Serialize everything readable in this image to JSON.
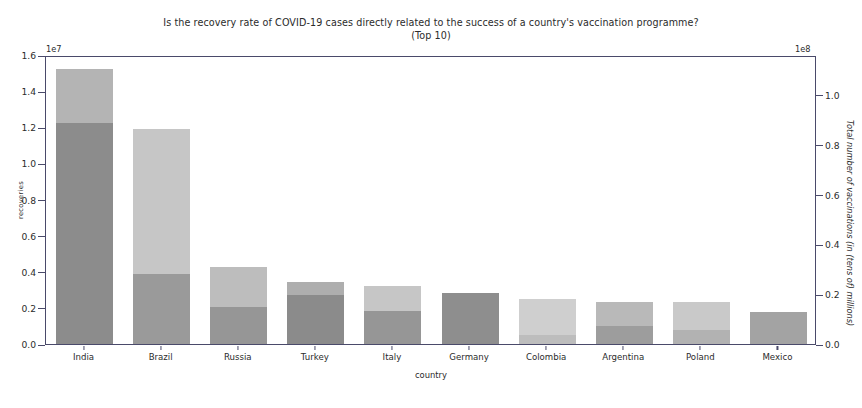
{
  "chart_data": {
    "type": "bar",
    "title": "Is the recovery rate of COVID-19 cases directly related to the success of a country's vaccination programme?",
    "subtitle": "(Top 10)",
    "xlabel": "country",
    "ylabel": "recoveries",
    "ylabel_right": "Total number of vaccinations (in (tens of) millions)",
    "categories": [
      "India",
      "Brazil",
      "Russia",
      "Turkey",
      "Italy",
      "Germany",
      "Colombia",
      "Argentina",
      "Poland",
      "Mexico"
    ],
    "series": [
      {
        "name": "recoveries",
        "axis": "left",
        "offset_text": "1e7",
        "color": "#8f8f8f",
        "values": [
          12250000,
          3900000,
          2050000,
          2700000,
          1850000,
          2800000,
          500000,
          1000000,
          750000,
          1800000
        ]
      },
      {
        "name": "total_vaccinations",
        "axis": "right",
        "offset_text": "1e8",
        "color": "#b5b5b5",
        "values": [
          95300000,
          74400000,
          26600000,
          21600000,
          20000000,
          17500000,
          15600000,
          14400000,
          14400000,
          11300000
        ]
      }
    ],
    "left_axis": {
      "offset_text": "1e7",
      "min": 0.0,
      "max": 1.6,
      "ticks": [
        "0.0",
        "0.2",
        "0.4",
        "0.6",
        "0.8",
        "1.0",
        "1.2",
        "1.4",
        "1.6"
      ],
      "tick_values": [
        0.0,
        0.2,
        0.4,
        0.6,
        0.8,
        1.0,
        1.2,
        1.4,
        1.6
      ]
    },
    "right_axis": {
      "offset_text": "1e8",
      "min": 0.0,
      "max": 1.16,
      "ticks": [
        "0.0",
        "0.2",
        "0.4",
        "0.6",
        "0.8",
        "1.0"
      ],
      "tick_values": [
        0.0,
        0.2,
        0.4,
        0.6,
        0.8,
        1.0
      ]
    },
    "bar_tops_left_units": {
      "recoveries": [
        1.225,
        0.39,
        0.205,
        0.27,
        0.185,
        0.28,
        0.05,
        0.1,
        0.075,
        0.18
      ],
      "vaccinations": [
        1.525,
        1.19,
        0.425,
        0.345,
        0.32,
        0.28,
        0.25,
        0.23,
        0.23,
        0.18
      ]
    },
    "grid": false,
    "legend": null
  },
  "colors": {
    "bar_recoveries": "#8f8f8f",
    "bar_vaccinations": "#b5b5b5",
    "bar_vaccinations_light": "#cdcdcd",
    "axis": "#4a4a6a",
    "text": "#2b2b2b",
    "background": "#ffffff"
  },
  "bar_shades": [
    {
      "rec": "#8c8c8c",
      "vac": "#b4b4b4"
    },
    {
      "rec": "#9a9a9a",
      "vac": "#c6c6c6"
    },
    {
      "rec": "#969696",
      "vac": "#bdbdbd"
    },
    {
      "rec": "#8b8b8b",
      "vac": "#aeaeae"
    },
    {
      "rec": "#969696",
      "vac": "#c6c6c6"
    },
    {
      "rec": "#8e8e8e",
      "vac": "#8e8e8e"
    },
    {
      "rec": "#bdbdbd",
      "vac": "#cfcfcf"
    },
    {
      "rec": "#9d9d9d",
      "vac": "#b9b9b9"
    },
    {
      "rec": "#b2b2b2",
      "vac": "#c9c9c9"
    },
    {
      "rec": "#a3a3a3",
      "vac": "#a3a3a3"
    }
  ]
}
